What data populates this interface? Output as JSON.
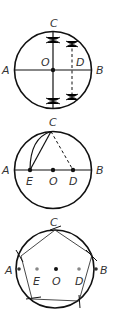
{
  "diagram": {
    "steps": [
      {
        "step": 1,
        "labels": {
          "A": "A",
          "B": "B",
          "C": "C",
          "O": "O",
          "D": "D"
        },
        "description": "Circle with perpendicular diameters AB and CD-axis; perpendicular bisector of OB locates D"
      },
      {
        "step": 2,
        "labels": {
          "A": "A",
          "B": "B",
          "C": "C",
          "E": "E",
          "O": "O",
          "D": "D"
        },
        "description": "Arc from C with radius DC locates E on AB; CE is the pentagon side"
      },
      {
        "step": 3,
        "labels": {
          "A": "A",
          "B": "B",
          "C": "C",
          "E": "E",
          "O": "O",
          "D": "D"
        },
        "description": "Step off side length CE around the circle to complete pentagon"
      }
    ],
    "colors": {
      "stroke": "#111111",
      "dot": "#111111",
      "grey_dot": "#888888",
      "label": "#333333"
    }
  }
}
